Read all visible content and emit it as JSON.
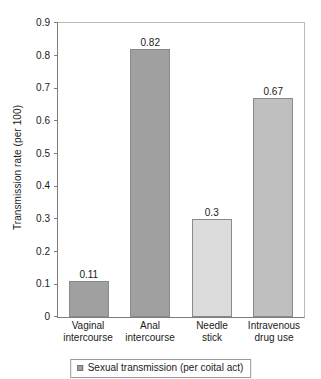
{
  "chart_data": {
    "type": "bar",
    "title": "",
    "xlabel": "",
    "ylabel": "Transmission rate (per 100)",
    "categories": [
      "Vaginal intercourse",
      "Anal intercourse",
      "Needle stick",
      "Intravenous drug use"
    ],
    "category_lines": [
      [
        "Vaginal",
        "intercourse"
      ],
      [
        "Anal",
        "intercourse"
      ],
      [
        "Needle",
        "stick"
      ],
      [
        "Intravenous",
        "drug use"
      ]
    ],
    "values": [
      0.11,
      0.82,
      0.3,
      0.67
    ],
    "value_labels": [
      "0.11",
      "0.82",
      "0.3",
      "0.67"
    ],
    "bar_colors": [
      "#a0a0a0",
      "#a0a0a0",
      "#dcdcdc",
      "#bfbfbf"
    ],
    "ylim": [
      0,
      0.9
    ],
    "ytick_values": [
      0.9,
      0.8,
      0.7,
      0.6,
      0.5,
      0.4,
      0.3,
      0.2,
      0.1,
      0
    ],
    "ytick_labels": [
      "0.9",
      "0.8",
      "0.7",
      "0.6",
      "0.5",
      "0.4",
      "0.3",
      "0.2",
      "0.1",
      "0"
    ],
    "grid": false,
    "legend_position": "bottom",
    "legend": [
      {
        "label": "Sexual transmission (per coital act)",
        "color": "#a0a0a0"
      }
    ]
  }
}
